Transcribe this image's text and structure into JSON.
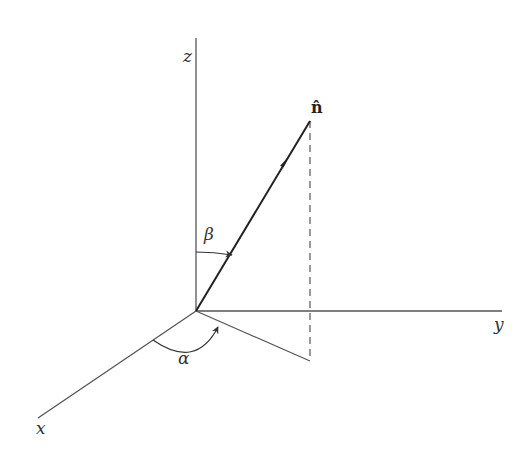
{
  "diagram": {
    "type": "3d-coordinate-system",
    "axes": {
      "x": {
        "label": "x"
      },
      "y": {
        "label": "y"
      },
      "z": {
        "label": "z"
      }
    },
    "vector": {
      "label": "n̂",
      "name": "unit normal vector"
    },
    "angles": {
      "beta": {
        "label": "β",
        "between": "z-axis and n̂"
      },
      "alpha": {
        "label": "α",
        "between": "x-axis and projection of n̂ onto xy-plane"
      }
    },
    "colors": {
      "axis": "#555555",
      "vector": "#222222",
      "background": "#ffffff"
    }
  }
}
